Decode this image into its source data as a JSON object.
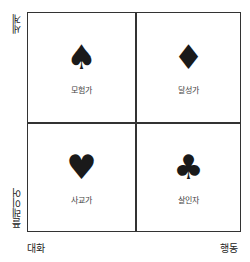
{
  "axes": {
    "y_top": "세계",
    "y_bottom": "플레이어",
    "x_left": "대화",
    "x_right": "행동"
  },
  "quadrants": [
    {
      "position": "top-left",
      "icon": "spade-icon",
      "glyph": "♠",
      "label": "모험가"
    },
    {
      "position": "top-right",
      "icon": "diamond-icon",
      "glyph": "♦",
      "label": "달성가"
    },
    {
      "position": "bottom-left",
      "icon": "heart-icon",
      "glyph": "♥",
      "label": "사교가"
    },
    {
      "position": "bottom-right",
      "icon": "club-icon",
      "glyph": "♣",
      "label": "살인자"
    }
  ],
  "colors": {
    "line": "#333333",
    "suit": "#1a1a1a",
    "background": "#ffffff"
  }
}
